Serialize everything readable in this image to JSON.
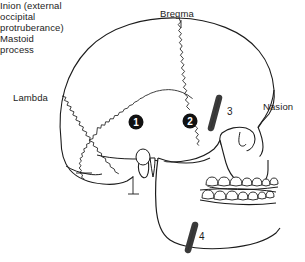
{
  "diagram": {
    "background_color": "#ffffff",
    "line_color": "#1c1c1c",
    "labels": {
      "bregma": "Bregma",
      "lambda": "Lambda",
      "nasion": "Nasion",
      "inion_line1": "Inion (external",
      "inion_line2": "occipital",
      "inion_line3": "protruberance)",
      "mastoid_line1": "Mastoid",
      "mastoid_line2": "process"
    },
    "markers": {
      "filled_circles": [
        {
          "id": "1",
          "number": "1",
          "cx": 136,
          "cy": 122,
          "r": 7.5,
          "fill": "#111111",
          "text_color": "#ffffff"
        },
        {
          "id": "2",
          "number": "2",
          "cx": 190,
          "cy": 121,
          "r": 7.5,
          "fill": "#111111",
          "text_color": "#ffffff"
        }
      ],
      "rods": [
        {
          "id": "3",
          "number": "3",
          "color": "#3a3a3a"
        },
        {
          "id": "4",
          "number": "4",
          "color": "#3a3a3a"
        }
      ]
    }
  }
}
